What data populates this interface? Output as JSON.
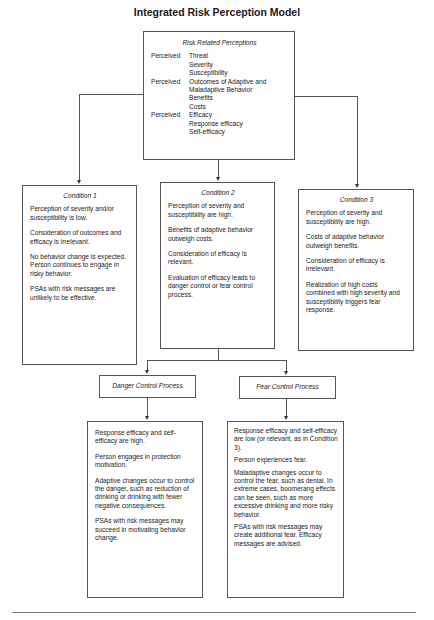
{
  "title": "Integrated Risk Perception Model",
  "top_box": {
    "heading": "Risk Related Perceptions",
    "rows": [
      {
        "label": "Perceived",
        "value": "Threat"
      },
      {
        "label": "",
        "value": "Severity"
      },
      {
        "label": "",
        "value": "Susceptibility"
      },
      {
        "label": "Perceived",
        "value": "Outcomes of Adaptive and"
      },
      {
        "label": "",
        "value": "Maladaptive Behavior"
      },
      {
        "label": "",
        "value": "Benefits"
      },
      {
        "label": "",
        "value": "Costs"
      },
      {
        "label": "Perceived",
        "value": "Efficacy"
      },
      {
        "label": "",
        "value": "Response efficacy"
      },
      {
        "label": "",
        "value": "Self-efficacy"
      }
    ]
  },
  "conditions": [
    {
      "heading": "Condition 1",
      "paragraphs": [
        "Perception of severity and/or susceptibility is low.",
        "Consideration of outcomes and efficacy is irrelevant.",
        "No behavior change is expected. Person continues to engage in risky behavior.",
        "PSAs with risk messages are unlikely to be effective."
      ]
    },
    {
      "heading": "Condition 2",
      "paragraphs": [
        "Perception of severity and susceptibility are high.",
        "Benefits of adaptive behavior outweigh costs.",
        "Consideration of efficacy is relevant.",
        "Evaluation of efficacy leads to danger control or fear control process."
      ]
    },
    {
      "heading": "Condition 3",
      "paragraphs": [
        "Perception of severity and susceptibility are high.",
        "Costs of adaptive behavior outweigh benefits.",
        "Consideration of efficacy is irrelevant.",
        "Realization of high costs combined with high severity and susceptibility triggers fear response."
      ]
    }
  ],
  "processes": [
    {
      "label": "Danger Control Process",
      "paragraphs": [
        "Response efficacy and self-efficacy are high.",
        "Person engages in protection motivation.",
        "Adaptive changes occur to control the danger, such as reduction of drinking or drinking with fewer negative consequences.",
        "PSAs with risk messages may succeed in motivating behavior change."
      ]
    },
    {
      "label": "Fear Control Process",
      "paragraphs": [
        "Response efficacy and self-efficacy are low (or relevant, as in Condition 3).",
        "Person experiences fear.",
        "Maladaptive changes occur to control the fear, such as denial. In extreme cases, boomerang effects can be seen, such as more excessive drinking and more risky behavior.",
        "PSAs with risk messages may create additional fear. Efficacy messages are advised."
      ]
    }
  ]
}
